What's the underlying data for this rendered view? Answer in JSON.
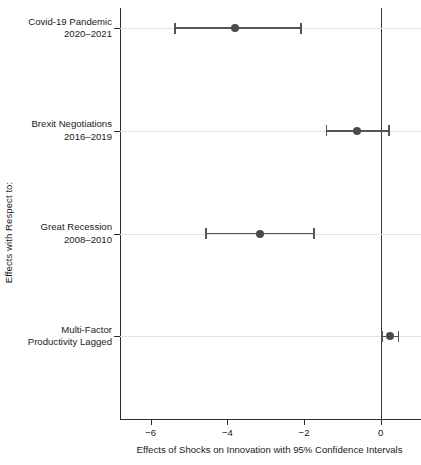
{
  "chart_data": {
    "type": "scatter",
    "title": "",
    "subtitle": "",
    "xlabel": "Effects of Shocks on Innovation with 95% Confidence Intervals",
    "ylabel": "Effects with Respect to:",
    "xlim": [
      -6.8,
      1.05
    ],
    "xticks": [
      -6,
      -4,
      -2,
      0
    ],
    "xticklabels": [
      "−6",
      "−4",
      "−2",
      "0"
    ],
    "grid": "horizontal-faint",
    "legend": "none",
    "reference_line": {
      "x": 0,
      "orientation": "vertical"
    },
    "error_bar_level": "95% confidence interval",
    "categories": [
      {
        "line1": "Covid-19 Pandemic",
        "line2": "2020–2021",
        "estimate": -3.8,
        "ci_low": -5.37,
        "ci_high": -2.08
      },
      {
        "line1": "Brexit Negotiations",
        "line2": "2016–2019",
        "estimate": -0.61,
        "ci_low": -1.42,
        "ci_high": 0.22
      },
      {
        "line1": "Great Recession",
        "line2": "2008–2010",
        "estimate": -3.14,
        "ci_low": -4.56,
        "ci_high": -1.74
      },
      {
        "line1": "Multi-Factor",
        "line2": "Productivity Lagged",
        "estimate": 0.25,
        "ci_low": 0.03,
        "ci_high": 0.47
      }
    ],
    "colors": {
      "point": "#4a4a4a",
      "interval": "#545454",
      "axis": "#2b2b2b",
      "gridline": "#e4e4e4",
      "reference_line": "#3a3a3a",
      "background": "#ffffff"
    }
  }
}
